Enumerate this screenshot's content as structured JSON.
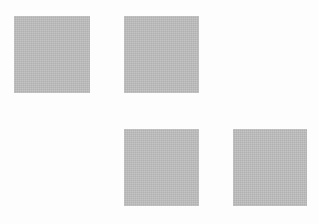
{
  "canvas": {
    "width": 318,
    "height": 224,
    "background": "#fdfdfd"
  },
  "squares": [
    {
      "id": "top-left",
      "x": 14,
      "y": 16,
      "w": 76,
      "h": 77,
      "color": "#bdbdbd"
    },
    {
      "id": "top-center",
      "x": 124,
      "y": 16,
      "w": 75,
      "h": 77,
      "color": "#bdbdbd"
    },
    {
      "id": "bottom-center",
      "x": 124,
      "y": 129,
      "w": 75,
      "h": 77,
      "color": "#bdbdbd"
    },
    {
      "id": "bottom-right",
      "x": 233,
      "y": 129,
      "w": 74,
      "h": 77,
      "color": "#bdbdbd"
    }
  ]
}
